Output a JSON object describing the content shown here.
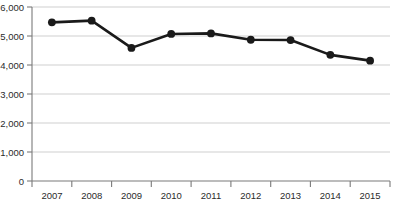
{
  "chart_data": {
    "type": "line",
    "title": "",
    "subtitle": "",
    "xlabel": "",
    "ylabel": "",
    "categories": [
      "2007",
      "2008",
      "2009",
      "2010",
      "2011",
      "2012",
      "2013",
      "2014",
      "2015"
    ],
    "values": [
      5470,
      5530,
      4590,
      5070,
      5090,
      4870,
      4860,
      4350,
      4150
    ],
    "series": [
      {
        "name": "",
        "values": [
          5470,
          5530,
          4590,
          5070,
          5090,
          4870,
          4860,
          4350,
          4150
        ]
      }
    ],
    "ylim": [
      0,
      6000
    ],
    "ytick_values": [
      0,
      1000,
      2000,
      3000,
      4000,
      5000,
      6000
    ],
    "ytick_labels": [
      "0",
      "1,000",
      "2,000",
      "3,000",
      "4,000",
      "5,000",
      "6,000"
    ],
    "xtick_labels": [
      "2007",
      "2008",
      "2009",
      "2010",
      "2011",
      "2012",
      "2013",
      "2014",
      "2015"
    ],
    "grid": true,
    "grid_axis": "y",
    "legend": false,
    "legend_position": "none",
    "line_color": "#1a1a1a",
    "marker": "circle",
    "marker_color": "#1a1a1a",
    "grid_color": "#c9c9c9",
    "axis_color": "#7a7a7a",
    "background_color": "#ffffff",
    "annotations": []
  }
}
